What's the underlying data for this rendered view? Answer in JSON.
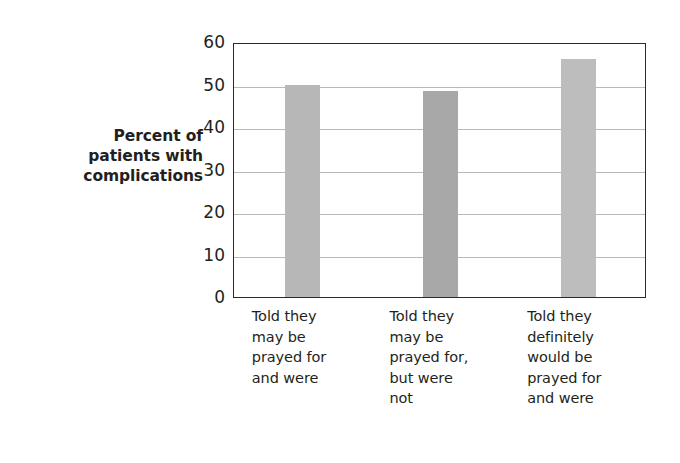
{
  "chart_data": {
    "type": "bar",
    "title": "",
    "subtitle": "",
    "xlabel": "",
    "ylabel": "Percent of patients with complications",
    "ylabel_lines": [
      "Percent of",
      "patients with",
      "complications"
    ],
    "categories": [
      "Told they may be prayed for and were",
      "Told they may be prayed for, but were not",
      "Told they definitely would be prayed for and were"
    ],
    "category_lines": [
      [
        "Told they",
        "may be",
        "prayed for",
        "and were"
      ],
      [
        "Told they",
        "may be",
        "prayed for,",
        "but were",
        "not"
      ],
      [
        "Told they",
        "definitely",
        "would be",
        "prayed for",
        "and were"
      ]
    ],
    "values": [
      50,
      48.5,
      56
    ],
    "ylim": [
      0,
      60
    ],
    "yticks": [
      0,
      10,
      20,
      30,
      40,
      50,
      60
    ],
    "ytick_labels": [
      "0",
      "10",
      "20",
      "30",
      "40",
      "50",
      "60"
    ],
    "grid": true,
    "grid_axis": "y",
    "legend": false,
    "legend_position": "none",
    "bar_colors": [
      "#b7b7b7",
      "#a8a8a8",
      "#bdbdbd"
    ],
    "bar_edge_color": "none",
    "frame_color": "#2b2b2b",
    "gridline_color": "#b9b9b9",
    "background_color": "#ffffff",
    "text_color": "#231f20"
  }
}
